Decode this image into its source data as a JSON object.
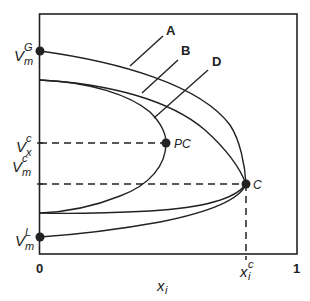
{
  "diagram": {
    "type": "phase-diagram",
    "axes": {
      "x_label": "x",
      "x_label_sub": "i",
      "x_ticks": [
        "0",
        "1"
      ],
      "x_special_tick": {
        "main": "x",
        "sub": "i",
        "sup": "c"
      }
    },
    "y_labels": {
      "vmg": {
        "main": "V",
        "sup": "G",
        "sub": "m"
      },
      "vxc": {
        "main": "V",
        "sup": "c",
        "sub": "x"
      },
      "vmc": {
        "main": "V",
        "sup": "c",
        "sub": "m"
      },
      "vml": {
        "main": "V",
        "sup": "L",
        "sub": "m"
      }
    },
    "curves": [
      {
        "label": "A"
      },
      {
        "label": "B"
      },
      {
        "label": "D"
      }
    ],
    "points": [
      {
        "label": "PC"
      },
      {
        "label": "C"
      }
    ],
    "colors": {
      "line": "#222222",
      "background": "#ffffff"
    }
  }
}
